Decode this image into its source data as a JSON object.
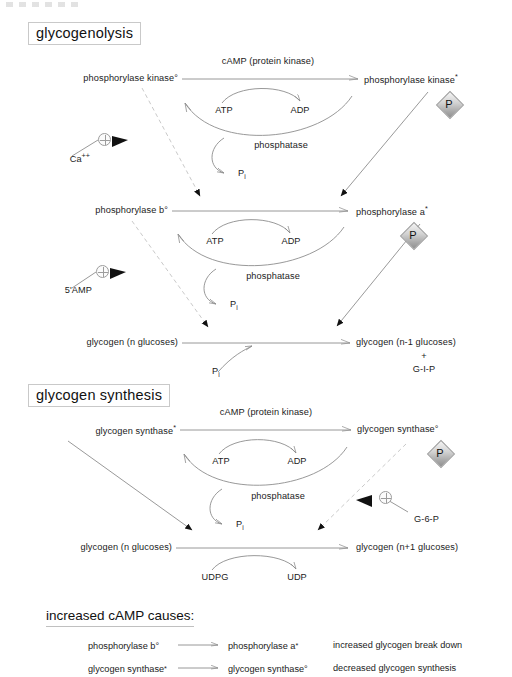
{
  "artifact": {
    "name": "top-edge-artifact"
  },
  "sections": {
    "glycogenolysis": {
      "title": "glycogenolysis",
      "top_row": {
        "left": "phosphorylase kinase",
        "left_mark": "°",
        "right": "phosphorylase kinase",
        "right_mark": "*",
        "forward_enzyme": "cAMP (protein kinase)",
        "forward_substrate": "ATP",
        "forward_product": "ADP",
        "reverse_enzyme": "phosphatase",
        "reverse_product": "P",
        "reverse_product_sub": "i",
        "phosphate_badge": "P"
      },
      "activator_1": {
        "label": "Ca",
        "label_sup": "++",
        "symbol": "circled-plus"
      },
      "middle_row": {
        "left": "phosphorylase b",
        "left_mark": "°",
        "right": "phosphorylase a",
        "right_mark": "*",
        "forward_substrate": "ATP",
        "forward_product": "ADP",
        "reverse_enzyme": "phosphatase",
        "reverse_product": "P",
        "reverse_product_sub": "i",
        "phosphate_badge": "P"
      },
      "activator_2": {
        "label": "5'AMP",
        "symbol": "circled-plus"
      },
      "bottom_row": {
        "left": "glycogen  (n glucoses)",
        "right_line1": "glycogen  (n-1 glucoses)",
        "right_line2": "+",
        "right_line3": "G-I-P",
        "cosubstrate": "P",
        "cosubstrate_sub": "i"
      }
    },
    "glycogen_synthesis": {
      "title": "glycogen synthesis",
      "top_row": {
        "left": "glycogen synthase",
        "left_mark": "*",
        "right": "glycogen synthase",
        "right_mark": "°",
        "forward_enzyme": "cAMP (protein kinase)",
        "forward_substrate": "ATP",
        "forward_product": "ADP",
        "reverse_enzyme": "phosphatase",
        "reverse_product": "P",
        "reverse_product_sub": "i",
        "phosphate_badge": "P"
      },
      "activator": {
        "label": "G-6-P",
        "symbol": "circled-plus"
      },
      "bottom_row": {
        "left": "glycogen (n glucoses)",
        "right": "glycogen (n+1 glucoses)",
        "substrate": "UDPG",
        "product": "UDP"
      }
    },
    "summary": {
      "title": "increased cAMP causes:",
      "rows": [
        {
          "from": "phosphorylase b",
          "from_mark": "°",
          "to": "phosphorylase a",
          "to_mark": "*",
          "effect": "increased glycogen break down"
        },
        {
          "from": "glycogen synthase",
          "from_mark": "*",
          "to": "glycogen synthase",
          "to_mark": "°",
          "effect": "decreased glycogen synthesis"
        }
      ]
    }
  },
  "colors": {
    "ink": "#1b1b1b",
    "line": "#8d8d8d",
    "dashed": "#c3c3c3",
    "box_border": "#c9c9c9",
    "arrowhead_solid": "#111111"
  }
}
